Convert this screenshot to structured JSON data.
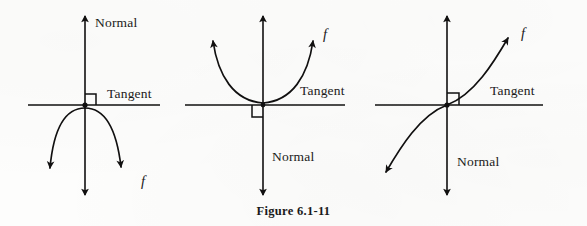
{
  "figure": {
    "caption": "Figure 6.1-11",
    "stroke_color": "#111010",
    "background_color": "#fdfdfc",
    "panels": [
      {
        "id": "panel-left",
        "normal_label": "Normal",
        "tangent_label": "Tangent",
        "function_label": "f",
        "curve_shape": "concave-down-arc",
        "right_angle_marker": true,
        "normal_label_position": "top",
        "tangent_label_position": "right-above-axis",
        "function_label_position": "bottom-right"
      },
      {
        "id": "panel-middle",
        "normal_label": "Normal",
        "tangent_label": "Tangent",
        "function_label": "f",
        "curve_shape": "concave-up-parabola",
        "right_angle_marker": true,
        "normal_label_position": "bottom",
        "tangent_label_position": "right-above-axis",
        "function_label_position": "top-right"
      },
      {
        "id": "panel-right",
        "normal_label": "Normal",
        "tangent_label": "Tangent",
        "function_label": "f",
        "curve_shape": "inflection-cubic",
        "right_angle_marker": true,
        "normal_label_position": "bottom",
        "tangent_label_position": "right-above-axis",
        "function_label_position": "top-right"
      }
    ]
  }
}
